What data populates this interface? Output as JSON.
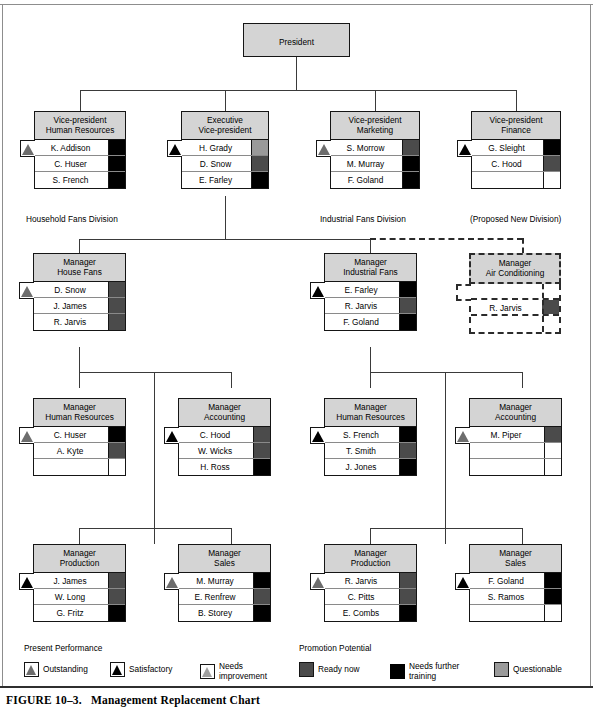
{
  "figure": {
    "number": "FIGURE 10–3.",
    "caption": "Management Replacement Chart"
  },
  "root": {
    "title_line1": "President",
    "title_line2": ""
  },
  "divisions": [
    {
      "label": "Household Fans Division"
    },
    {
      "label": "Industrial Fans Division"
    },
    {
      "label": "(Proposed New Division)"
    }
  ],
  "units": [
    {
      "id": "vp-human-resources",
      "title_line1": "Vice-president",
      "title_line2": "Human Resources",
      "performance": "Outstanding",
      "people": [
        {
          "name": "K. Addison",
          "potential": "Needs further training"
        },
        {
          "name": "C. Huser",
          "potential": "Needs further training"
        },
        {
          "name": "S. French",
          "potential": "Needs further training"
        }
      ]
    },
    {
      "id": "executive-vice-president",
      "title_line1": "Executive",
      "title_line2": "Vice-president",
      "performance": "Satisfactory",
      "people": [
        {
          "name": "H. Grady",
          "potential": "Questionable"
        },
        {
          "name": "D. Snow",
          "potential": "Ready now"
        },
        {
          "name": "E. Farley",
          "potential": "Needs further training"
        }
      ]
    },
    {
      "id": "vp-marketing",
      "title_line1": "Vice-president",
      "title_line2": "Marketing",
      "performance": "Outstanding",
      "people": [
        {
          "name": "S. Morrow",
          "potential": "Ready now"
        },
        {
          "name": "M. Murray",
          "potential": "Needs further training"
        },
        {
          "name": "F. Goland",
          "potential": "Needs further training"
        }
      ]
    },
    {
      "id": "vp-finance",
      "title_line1": "Vice-president",
      "title_line2": "Finance",
      "performance": "Satisfactory",
      "people": [
        {
          "name": "G. Sleight",
          "potential": "Needs further training"
        },
        {
          "name": "C. Hood",
          "potential": "Ready now"
        },
        {
          "name": "",
          "potential": ""
        }
      ]
    },
    {
      "id": "manager-house-fans",
      "title_line1": "Manager",
      "title_line2": "House Fans",
      "performance": "Outstanding",
      "people": [
        {
          "name": "D. Snow",
          "potential": "Ready now"
        },
        {
          "name": "J. James",
          "potential": "Ready now"
        },
        {
          "name": "R. Jarvis",
          "potential": "Ready now"
        }
      ]
    },
    {
      "id": "manager-industrial-fans",
      "title_line1": "Manager",
      "title_line2": "Industrial Fans",
      "performance": "Satisfactory",
      "people": [
        {
          "name": "E. Farley",
          "potential": "Needs further training"
        },
        {
          "name": "R. Jarvis",
          "potential": "Ready now"
        },
        {
          "name": "F. Goland",
          "potential": "Needs further training"
        }
      ]
    },
    {
      "id": "manager-air-conditioning",
      "title_line1": "Manager",
      "title_line2": "Air Conditioning",
      "performance": "",
      "proposed": true,
      "people": [
        {
          "name": "",
          "potential": ""
        },
        {
          "name": "R. Jarvis",
          "potential": "Ready now"
        },
        {
          "name": "",
          "potential": ""
        }
      ]
    },
    {
      "id": "manager-human-resources-household",
      "title_line1": "Manager",
      "title_line2": "Human Resources",
      "performance": "Outstanding",
      "people": [
        {
          "name": "C. Huser",
          "potential": "Needs further training"
        },
        {
          "name": "A. Kyte",
          "potential": "Ready now"
        },
        {
          "name": "",
          "potential": ""
        }
      ]
    },
    {
      "id": "manager-accounting-household",
      "title_line1": "Manager",
      "title_line2": "Accounting",
      "performance": "Satisfactory",
      "people": [
        {
          "name": "C. Hood",
          "potential": "Ready now"
        },
        {
          "name": "W. Wicks",
          "potential": "Ready now"
        },
        {
          "name": "H. Ross",
          "potential": "Needs further training"
        }
      ]
    },
    {
      "id": "manager-human-resources-industrial",
      "title_line1": "Manager",
      "title_line2": "Human Resources",
      "performance": "Satisfactory",
      "people": [
        {
          "name": "S. French",
          "potential": "Needs further training"
        },
        {
          "name": "T. Smith",
          "potential": "Ready now"
        },
        {
          "name": "J. Jones",
          "potential": "Needs further training"
        }
      ]
    },
    {
      "id": "manager-accounting-industrial",
      "title_line1": "Manager",
      "title_line2": "Accounting",
      "performance": "Outstanding",
      "people": [
        {
          "name": "M. Piper",
          "potential": "Ready now"
        },
        {
          "name": "",
          "potential": ""
        },
        {
          "name": "",
          "potential": ""
        }
      ]
    },
    {
      "id": "manager-production-household",
      "title_line1": "Manager",
      "title_line2": "Production",
      "performance": "Satisfactory",
      "people": [
        {
          "name": "J. James",
          "potential": "Ready now"
        },
        {
          "name": "W. Long",
          "potential": "Ready now"
        },
        {
          "name": "G. Fritz",
          "potential": "Needs further training"
        }
      ]
    },
    {
      "id": "manager-sales-household",
      "title_line1": "Manager",
      "title_line2": "Sales",
      "performance": "Outstanding",
      "people": [
        {
          "name": "M. Murray",
          "potential": "Needs further training"
        },
        {
          "name": "E. Renfrew",
          "potential": "Ready now"
        },
        {
          "name": "B. Storey",
          "potential": "Needs further training"
        }
      ]
    },
    {
      "id": "manager-production-industrial",
      "title_line1": "Manager",
      "title_line2": "Production",
      "performance": "Outstanding",
      "people": [
        {
          "name": "R. Jarvis",
          "potential": "Ready now"
        },
        {
          "name": "C. Pitts",
          "potential": "Ready now"
        },
        {
          "name": "E. Combs",
          "potential": "Needs further training"
        }
      ]
    },
    {
      "id": "manager-sales-industrial",
      "title_line1": "Manager",
      "title_line2": "Sales",
      "performance": "Satisfactory",
      "people": [
        {
          "name": "F. Goland",
          "potential": "Needs further training"
        },
        {
          "name": "S. Ramos",
          "potential": "Needs further training"
        },
        {
          "name": "",
          "potential": ""
        }
      ]
    }
  ],
  "legend": {
    "performance": {
      "heading": "Present Performance",
      "items": [
        {
          "label": "Outstanding",
          "swatch": "triangle-gray-icon"
        },
        {
          "label": "Satisfactory",
          "swatch": "triangle-black-icon"
        },
        {
          "label": "Needs\nimprovement",
          "swatch": "triangle-light-gray-icon"
        }
      ]
    },
    "potential": {
      "heading": "Promotion Potential",
      "items": [
        {
          "label": "Ready now",
          "swatch": "square-dark-gray-icon"
        },
        {
          "label": "Needs further\ntraining",
          "swatch": "square-black-icon"
        },
        {
          "label": "Questionable",
          "swatch": "square-gray-icon"
        }
      ]
    }
  },
  "colors": {
    "title_fill": "#d4d4d4",
    "ready_now": "#4b4b4b",
    "needs_training": "#000000",
    "questionable": "#9a9a9a",
    "outstanding": "#6d6d6d",
    "satisfactory": "#000000",
    "needs_improvement": "#a0a0a0",
    "line": "#3a3a3a"
  }
}
